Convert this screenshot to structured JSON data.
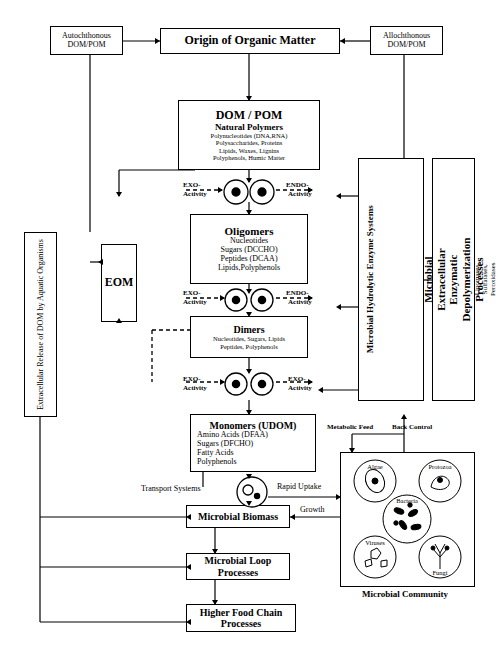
{
  "title": "Origin of Organic Matter",
  "nodes": {
    "autochthonous": {
      "line1": "Autochthonous",
      "line2": "DOM/POM"
    },
    "allochthonous": {
      "line1": "Allochthonous",
      "line2": "DOM/POM"
    },
    "origin": "Origin of Organic Matter",
    "dom_pom": {
      "header": "DOM / POM",
      "subheader": "Natural Polymers",
      "items": [
        "Polynucleotides (DNA,RNA)",
        "Polysaccharides, Proteins",
        "Lipids, Waxes, Lignins",
        "Polyphenols, Humic Matter"
      ]
    },
    "oligomers": {
      "header": "Oligomers",
      "items": [
        "Nucleotides",
        "Sugars (DCCHO)",
        "Peptides (DCAA)",
        "Lipids,Polyphenols"
      ]
    },
    "dimers": {
      "header": "Dimers",
      "items": [
        "Nucleotides, Sugars, Lipids",
        "Peptides, Polyphenols"
      ]
    },
    "monomers": {
      "header": "Monomers (UDOM)",
      "items": [
        "Amino Acids (DFAA)",
        "Sugars (DFCHO)",
        "Fatty Acids",
        "Polyphenols"
      ]
    },
    "eom": "EOM",
    "extracellular_release": "Extracellular Release of DOM by Aquatic Organisms",
    "enzyme_systems": {
      "title": "Microbial Hydrolytic Enzyme Systems",
      "items": "Nucleotidases, Phosphatases, Glycosidases, Proteases, Lipases, Lipomases, Sulfatases, Peroxidases"
    },
    "depolymerization": "Microbial Extracellular Enzymatic Depolymerization Processes",
    "microbial_biomass": "Microbial Biomass",
    "microbial_loop": {
      "line1": "Microbial Loop",
      "line2": "Processes"
    },
    "higher_food_chain": {
      "line1": "Higher Food Chain",
      "line2": "Processes"
    },
    "microbial_community": {
      "caption": "Microbial Community",
      "members": [
        "Algae",
        "Protozoa",
        "Bacteria",
        "Viruses",
        "Fungi"
      ]
    }
  },
  "labels": {
    "exo1": "EXO-\nActivity",
    "endo1": "ENDO-\nActivity",
    "exo2": "EXO-\nActivity",
    "endo2": "ENDO-\nActivity",
    "exo3": "EXO-\nActivity",
    "exo4": "EXO-\nActivity",
    "exo_a": "EXO-",
    "exo_b": "Activity",
    "endo_a": "ENDO-",
    "endo_b": "Activity",
    "metabolic_feed": "Metabolic Feed",
    "back_control": "Back Control",
    "rapid_uptake": "Rapid Uptake",
    "transport_systems": "Transport Systems",
    "growth": "Growth"
  }
}
